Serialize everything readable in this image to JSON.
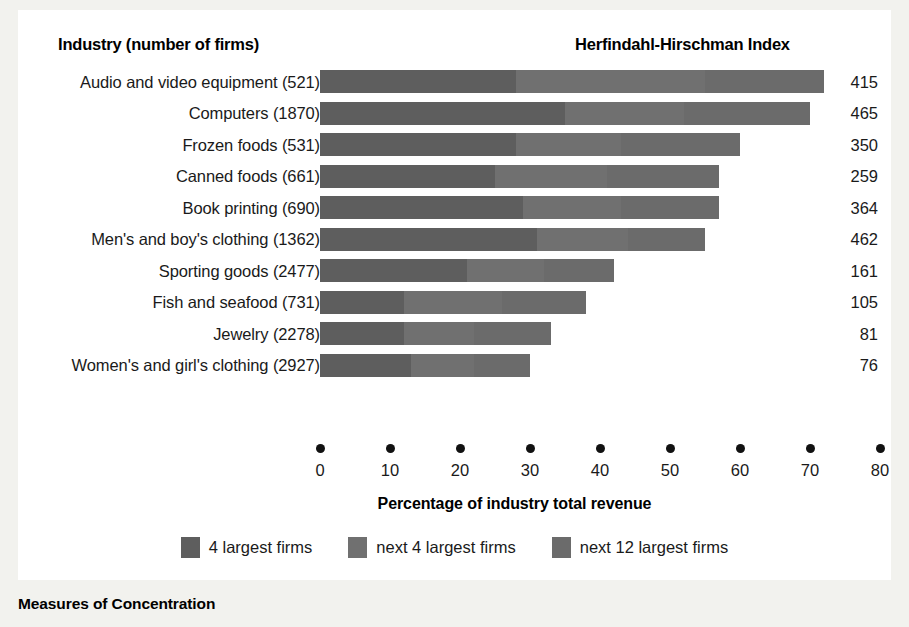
{
  "header": {
    "industry_label": "Industry (number of firms)",
    "hhi_label": "Herfindahl-Hirschman Index"
  },
  "caption": "Measures of Concentration",
  "chart_data": {
    "type": "bar",
    "orientation": "horizontal",
    "stacked": true,
    "title": "Measures of Concentration",
    "xlabel": "Percentage of industry total revenue",
    "ylabel": "Industry (number of firms)",
    "xlim": [
      0,
      80
    ],
    "xticks": [
      0,
      10,
      20,
      30,
      40,
      50,
      60,
      70,
      80
    ],
    "xticklabels": [
      "0",
      "10",
      "20",
      "30",
      "40",
      "50",
      "60",
      "70",
      "80"
    ],
    "grid": false,
    "legend_position": "bottom-center",
    "legend": [
      "4 largest firms",
      "next 4 largest firms",
      "next 12 largest firms"
    ],
    "colors": {
      "series_1": "#5e5e5e",
      "series_2": "#707070",
      "series_3": "#6b6b6b",
      "background": "#ffffff",
      "page": "#f2f2ee",
      "text": "#1a1a1a"
    },
    "categories": [
      "Audio and video equipment  (521)",
      "Computers  (1870)",
      "Frozen foods  (531)",
      "Canned foods  (661)",
      "Book printing  (690)",
      "Men's and boy's clothing  (1362)",
      "Sporting goods  (2477)",
      "Fish and seafood  (731)",
      "Jewelry  (2278)",
      "Women's and girl's clothing  (2927)"
    ],
    "series": [
      {
        "name": "4 largest firms",
        "values": [
          28,
          35,
          28,
          25,
          29,
          31,
          21,
          12,
          12,
          13
        ]
      },
      {
        "name": "next 4 largest firms",
        "values": [
          27,
          17,
          15,
          16,
          14,
          13,
          11,
          14,
          10,
          9
        ]
      },
      {
        "name": "next 12 largest firms",
        "values": [
          17,
          18,
          17,
          16,
          14,
          11,
          10,
          12,
          11,
          8
        ]
      }
    ],
    "totals": [
      72,
      70,
      60,
      57,
      57,
      55,
      42,
      38,
      33,
      30
    ],
    "annotations": {
      "hhi_column_header": "Herfindahl-Hirschman Index",
      "hhi_values": [
        415,
        465,
        350,
        259,
        364,
        462,
        161,
        105,
        81,
        76
      ]
    }
  }
}
